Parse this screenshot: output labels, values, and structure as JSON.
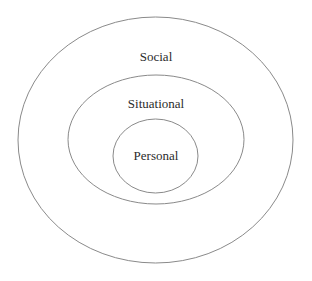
{
  "diagram": {
    "type": "concentric-circles",
    "title": "",
    "background_color": "#ffffff",
    "stroke_color": "#8a8a8a",
    "text_color": "#2b2b2b",
    "rings": [
      {
        "id": "social",
        "label": "Social",
        "level": 3,
        "role": "outermost",
        "shape": "ellipse",
        "cx": 155.5,
        "cy": 140,
        "rx": 137.5,
        "ry": 123
      },
      {
        "id": "situational",
        "label": "Situational",
        "level": 2,
        "role": "middle",
        "shape": "ellipse",
        "cx": 156,
        "cy": 139.5,
        "rx": 88,
        "ry": 64.5
      },
      {
        "id": "personal",
        "label": "Personal",
        "level": 1,
        "role": "innermost",
        "shape": "ellipse",
        "cx": 155.5,
        "cy": 156,
        "rx": 42.5,
        "ry": 37
      }
    ]
  }
}
